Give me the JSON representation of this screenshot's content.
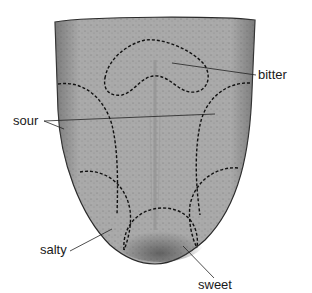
{
  "diagram": {
    "regions": [
      {
        "id": "bitter",
        "label": "bitter"
      },
      {
        "id": "sour",
        "label": "sour"
      },
      {
        "id": "salty",
        "label": "salty"
      },
      {
        "id": "sweet",
        "label": "sweet"
      }
    ]
  }
}
